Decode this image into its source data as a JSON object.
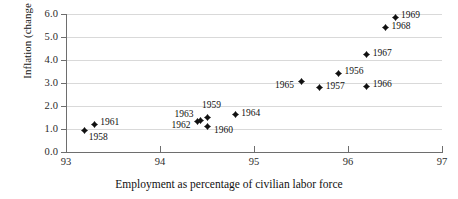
{
  "chart_data": {
    "type": "scatter",
    "title": "",
    "xlabel": "Employment as percentage of civilian labor force",
    "ylabel": "Inflation (change in CPI)",
    "xlim": [
      93,
      97
    ],
    "ylim": [
      0.0,
      6.0
    ],
    "xticks": [
      "93",
      "94",
      "95",
      "96",
      "97"
    ],
    "yticks": [
      "0.0",
      "1.0",
      "2.0",
      "3.0",
      "4.0",
      "5.0",
      "6.0"
    ],
    "grid": "horizontal",
    "legend": "none",
    "marker_color": "#111111",
    "gridline_color": "#d9d9d9",
    "axis_color": "#6e6e6e",
    "points": [
      {
        "label": "1958",
        "x": 93.2,
        "y": 0.95,
        "lx": 4,
        "ly": 7
      },
      {
        "label": "1961",
        "x": 93.3,
        "y": 1.2,
        "lx": 6,
        "ly": -2
      },
      {
        "label": "1962",
        "x": 94.4,
        "y": 1.32,
        "lx": -26,
        "ly": 3
      },
      {
        "label": "1963",
        "x": 94.43,
        "y": 1.37,
        "lx": -26,
        "ly": -6
      },
      {
        "label": "1959",
        "x": 94.51,
        "y": 1.52,
        "lx": -6,
        "ly": -12
      },
      {
        "label": "1960",
        "x": 94.51,
        "y": 1.1,
        "lx": 6,
        "ly": 3
      },
      {
        "label": "1964",
        "x": 94.8,
        "y": 1.62,
        "lx": 6,
        "ly": -2
      },
      {
        "label": "1965",
        "x": 95.5,
        "y": 3.05,
        "lx": -26,
        "ly": 3
      },
      {
        "label": "1957",
        "x": 95.7,
        "y": 2.8,
        "lx": 6,
        "ly": -2
      },
      {
        "label": "1956",
        "x": 95.9,
        "y": 3.42,
        "lx": 6,
        "ly": -2
      },
      {
        "label": "1966",
        "x": 96.2,
        "y": 2.85,
        "lx": 6,
        "ly": -2
      },
      {
        "label": "1967",
        "x": 96.2,
        "y": 4.22,
        "lx": 6,
        "ly": -2
      },
      {
        "label": "1968",
        "x": 96.4,
        "y": 5.4,
        "lx": 6,
        "ly": -2
      },
      {
        "label": "1969",
        "x": 96.5,
        "y": 5.85,
        "lx": 6,
        "ly": -2
      }
    ]
  }
}
